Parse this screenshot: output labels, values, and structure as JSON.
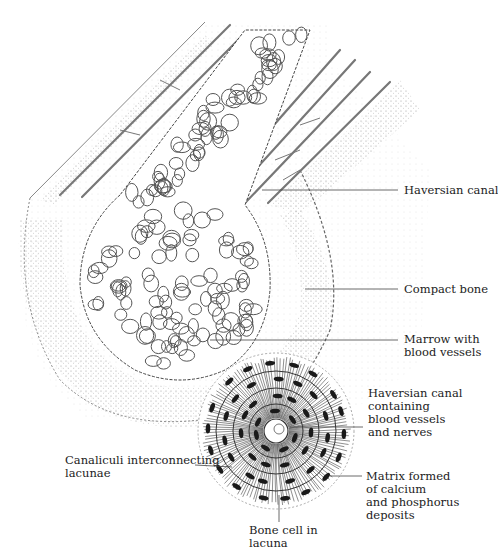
{
  "diagram": {
    "colors": {
      "ink": "#333333",
      "stipple": "#8a8a8a",
      "background": "#ffffff",
      "cell": "#1a1a1a"
    },
    "labels": [
      {
        "id": "haversian-canal",
        "text": "Haversian canal",
        "x": 404,
        "y": 184,
        "line": [
          [
            262,
            190
          ],
          [
            398,
            190
          ]
        ]
      },
      {
        "id": "compact-bone",
        "text": "Compact bone",
        "x": 404,
        "y": 283,
        "line": [
          [
            305,
            289
          ],
          [
            398,
            289
          ]
        ]
      },
      {
        "id": "marrow",
        "text": "Marrow with\nblood vessels",
        "x": 404,
        "y": 333,
        "line": [
          [
            210,
            340
          ],
          [
            398,
            340
          ]
        ]
      },
      {
        "id": "haversian-canal-containing",
        "text": "Haversian canal\ncontaining\nblood vessels\nand nerves",
        "x": 368,
        "y": 387,
        "line": [
          [
            290,
            427
          ],
          [
            363,
            427
          ]
        ]
      },
      {
        "id": "matrix",
        "text": "Matrix formed\nof calcium\nand phosphorus\ndeposits",
        "x": 366,
        "y": 470,
        "line": [
          [
            330,
            476
          ],
          [
            362,
            476
          ]
        ]
      },
      {
        "id": "canaliculi",
        "text": "Canaliculi interconnecting\nlacunae",
        "x": 65,
        "y": 454,
        "line": [
          [
            195,
            465
          ],
          [
            232,
            467
          ]
        ]
      },
      {
        "id": "bone-cell",
        "text": "Bone cell in\nlacuna",
        "x": 249,
        "y": 524,
        "line": [
          [
            279,
            495
          ],
          [
            279,
            522
          ]
        ]
      }
    ]
  }
}
